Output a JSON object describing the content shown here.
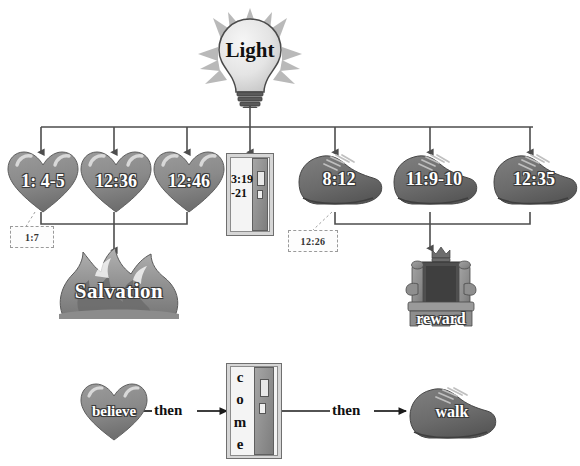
{
  "diagram": {
    "title_hidden": "",
    "source": {
      "id": "light",
      "label": "Light",
      "shape": "lightbulb"
    },
    "belief_group": {
      "shape": "heart",
      "nodes": [
        {
          "id": "heart-1",
          "label": "1: 4-5"
        },
        {
          "id": "heart-2",
          "label": "12:36"
        },
        {
          "id": "heart-3",
          "label": "12:46"
        }
      ],
      "annotation": {
        "id": "tag-1-7",
        "label": "1:7"
      },
      "result": {
        "id": "salvation",
        "label": "Salvation",
        "shape": "fire"
      }
    },
    "door_node": {
      "id": "door-top",
      "shape": "door",
      "label_line1": "3:19",
      "label_line2": "-21"
    },
    "walk_group": {
      "shape": "shoe",
      "nodes": [
        {
          "id": "shoe-1",
          "label": "8:12"
        },
        {
          "id": "shoe-2",
          "label": "11:9-10"
        },
        {
          "id": "shoe-3",
          "label": "12:35"
        }
      ],
      "annotation": {
        "id": "tag-12-26",
        "label": "12:26"
      },
      "result": {
        "id": "reward",
        "label": "reward",
        "shape": "throne"
      }
    },
    "flow": {
      "steps": [
        {
          "id": "flow-believe",
          "label": "believe",
          "shape": "heart"
        },
        {
          "id": "flow-come",
          "label": "come",
          "letters": [
            "c",
            "o",
            "m",
            "e"
          ],
          "shape": "door"
        },
        {
          "id": "flow-walk",
          "label": "walk",
          "shape": "shoe"
        }
      ],
      "connectors": [
        {
          "id": "connector-then-1",
          "label": "then"
        },
        {
          "id": "connector-then-2",
          "label": "then"
        }
      ]
    },
    "colors": {
      "heart": "#8a8a8a",
      "shoe": "#6e6e6e",
      "line": "#4d4d4d",
      "bulb": "#e9e9e9",
      "rays": "#b8b8b8",
      "fire": "#9a9a9a",
      "throne": "#8d8d8d",
      "label_text": "#ffffff",
      "background": "#ffffff"
    }
  }
}
